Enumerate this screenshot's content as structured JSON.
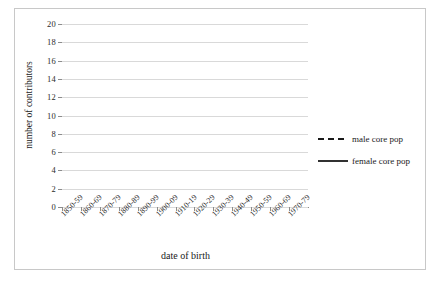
{
  "chart_data": {
    "type": "line",
    "title": "",
    "xlabel": "date of birth",
    "ylabel": "number of contributors",
    "ylim": [
      0,
      20
    ],
    "ytick_step": 2,
    "yticks": [
      "0",
      "2",
      "4",
      "6",
      "8",
      "10",
      "12",
      "14",
      "16",
      "18",
      "20"
    ],
    "grid": true,
    "legend_position": "right",
    "categories": [
      "1850-59",
      "1860-69",
      "1870-79",
      "1880-89",
      "1890-99",
      "1900-09",
      "1910-19",
      "1920-29",
      "1930-39",
      "1940-49",
      "1950-59",
      "1960-69",
      "1970-79"
    ],
    "series": [
      {
        "name": "male core pop",
        "style": "dashed",
        "color": "#1a1a1a",
        "values": [
          0,
          0,
          2,
          6,
          10,
          14,
          18,
          4,
          3,
          2,
          1,
          0,
          0
        ]
      },
      {
        "name": "female core pop",
        "style": "solid",
        "color": "#1a1a1a",
        "values": [
          1,
          1,
          2,
          8,
          10,
          6,
          6,
          2,
          5,
          0,
          2,
          0,
          0
        ]
      }
    ]
  },
  "legend": {
    "items": [
      {
        "label": "male core pop",
        "style": "dashed"
      },
      {
        "label": "female core pop",
        "style": "solid"
      }
    ]
  },
  "axes": {
    "x_title": "date of birth",
    "y_title": "number of contributors"
  }
}
